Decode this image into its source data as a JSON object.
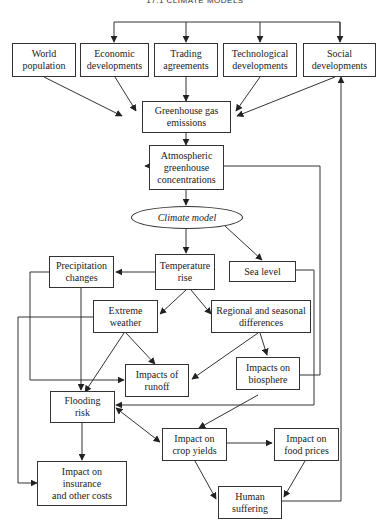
{
  "header": {
    "title": "17.1 CLIMATE MODELS"
  },
  "nodes": {
    "world_population": "World\npopulation",
    "economic_developments": "Economic\ndevelopments",
    "trading_agreements": "Trading\nagreements",
    "technological_developments": "Technological\ndevelopments",
    "social_developments": "Social\ndevelopments",
    "greenhouse_gas_emissions": "Greenhouse gas\nemissions",
    "atmospheric_concentrations": "Atmospheric\ngreenhouse\nconcentrations",
    "climate_model": "Climate model",
    "precipitation_changes": "Precipitation\nchanges",
    "temperature_rise": "Temperature\nrise",
    "sea_level": "Sea level",
    "extreme_weather": "Extreme\nweather",
    "regional_differences": "Regional and seasonal\ndifferences",
    "impacts_of_runoff": "Impacts of\nrunoff",
    "impacts_on_biosphere": "Impacts on\nbiosphere",
    "flooding_risk": "Flooding\nrisk",
    "impact_crop_yields": "Impact on\ncrop yields",
    "impact_food_prices": "Impact on\nfood prices",
    "impact_insurance": "Impact on\ninsurance\nand other costs",
    "human_suffering": "Human\nsuffering"
  },
  "edges": [
    [
      "social_developments",
      "economic_developments"
    ],
    [
      "social_developments",
      "trading_agreements"
    ],
    [
      "social_developments",
      "technological_developments"
    ],
    [
      "world_population",
      "greenhouse_gas_emissions"
    ],
    [
      "economic_developments",
      "greenhouse_gas_emissions"
    ],
    [
      "trading_agreements",
      "greenhouse_gas_emissions"
    ],
    [
      "technological_developments",
      "greenhouse_gas_emissions"
    ],
    [
      "social_developments",
      "greenhouse_gas_emissions"
    ],
    [
      "greenhouse_gas_emissions",
      "atmospheric_concentrations"
    ],
    [
      "atmospheric_concentrations",
      "climate_model"
    ],
    [
      "climate_model",
      "temperature_rise"
    ],
    [
      "climate_model",
      "sea_level"
    ],
    [
      "temperature_rise",
      "precipitation_changes"
    ],
    [
      "temperature_rise",
      "extreme_weather"
    ],
    [
      "temperature_rise",
      "regional_differences"
    ],
    [
      "precipitation_changes",
      "flooding_risk"
    ],
    [
      "precipitation_changes",
      "impacts_of_runoff"
    ],
    [
      "extreme_weather",
      "flooding_risk"
    ],
    [
      "extreme_weather",
      "impacts_of_runoff"
    ],
    [
      "extreme_weather",
      "impact_insurance"
    ],
    [
      "regional_differences",
      "impacts_of_runoff"
    ],
    [
      "regional_differences",
      "impacts_on_biosphere"
    ],
    [
      "impacts_on_biosphere",
      "atmospheric_concentrations"
    ],
    [
      "impacts_on_biosphere",
      "impact_crop_yields"
    ],
    [
      "sea_level",
      "flooding_risk"
    ],
    [
      "flooding_risk",
      "impact_crop_yields"
    ],
    [
      "flooding_risk",
      "impact_insurance"
    ],
    [
      "impact_crop_yields",
      "impact_food_prices"
    ],
    [
      "impact_crop_yields",
      "human_suffering"
    ],
    [
      "impact_food_prices",
      "human_suffering"
    ],
    [
      "human_suffering",
      "social_developments"
    ]
  ]
}
